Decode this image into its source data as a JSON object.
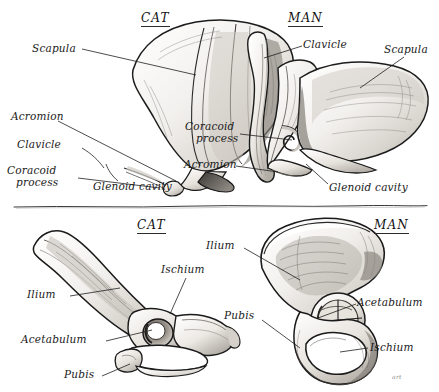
{
  "plate": {
    "background_color": "#ffffff",
    "ink_color": "#1a1a1a",
    "divider": "hand-drawn-horizontal-rule",
    "signature": "art"
  },
  "panels": [
    {
      "id": "cat-pectoral-girdle",
      "heading": "CAT",
      "region": "top-left",
      "labels": [
        {
          "name": "scapula",
          "text": "Scapula"
        },
        {
          "name": "acromion",
          "text": "Acromion"
        },
        {
          "name": "clavicle",
          "text": "Clavicle"
        },
        {
          "name": "coracoid-process",
          "text": "Coracoid",
          "text2": "process"
        },
        {
          "name": "glenoid-cavity",
          "text": "Glenoid  cavity"
        }
      ]
    },
    {
      "id": "man-pectoral-girdle",
      "heading": "MAN",
      "region": "top-right",
      "labels": [
        {
          "name": "clavicle",
          "text": "Clavicle"
        },
        {
          "name": "scapula",
          "text": "Scapula"
        },
        {
          "name": "coracoid-process",
          "text": "Coracoid",
          "text2": "process"
        },
        {
          "name": "acromion",
          "text": "Acromion"
        },
        {
          "name": "glenoid-cavity",
          "text": "Glenoid  cavity"
        }
      ]
    },
    {
      "id": "cat-pelvic-girdle",
      "heading": "CAT",
      "region": "bottom-left",
      "labels": [
        {
          "name": "ischium",
          "text": "Ischium"
        },
        {
          "name": "ilium",
          "text": "Ilium"
        },
        {
          "name": "acetabulum",
          "text": "Acetabulum"
        },
        {
          "name": "pubis",
          "text": "Pubis"
        }
      ]
    },
    {
      "id": "man-pelvic-girdle",
      "heading": "MAN",
      "region": "bottom-right",
      "labels": [
        {
          "name": "ilium",
          "text": "Ilium"
        },
        {
          "name": "acetabulum",
          "text": "Acetabulum"
        },
        {
          "name": "pubis",
          "text": "Pubis"
        },
        {
          "name": "ischium",
          "text": "Ischium"
        }
      ]
    }
  ]
}
